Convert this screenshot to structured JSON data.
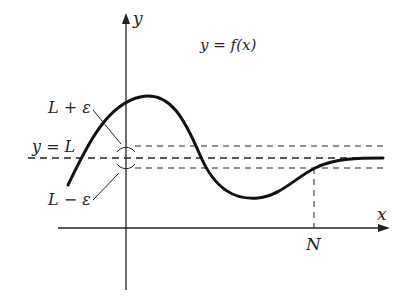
{
  "diagram": {
    "function_label": "y = f(x)",
    "axes": {
      "x_label": "x",
      "y_label": "y"
    },
    "lines": {
      "limit_label": "y = L",
      "upper_band_label": "L + ε",
      "lower_band_label": "L − ε"
    },
    "marker": {
      "n_label": "N"
    },
    "colors": {
      "ink": "#222222",
      "background": "#ffffff"
    }
  }
}
